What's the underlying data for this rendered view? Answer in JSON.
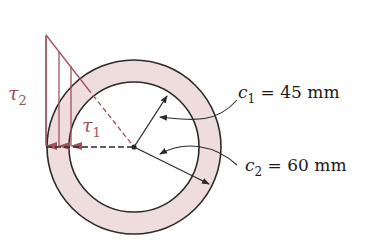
{
  "figure": {
    "type": "hollow-shaft-cross-section",
    "colors": {
      "ring_fill": "#efdcdc",
      "outline": "#2a2a2a",
      "stress": "#a0525a",
      "background": "#ffffff"
    }
  },
  "labels": {
    "tau2": "τ",
    "tau2_sub": "2",
    "tau1": "τ",
    "tau1_sub": "1",
    "c1_sym": "c",
    "c1_sub": "1",
    "c1_rest": " = 45 mm",
    "c2_sym": "c",
    "c2_sub": "2",
    "c2_rest": " = 60 mm"
  },
  "dimensions": {
    "c1": "45 mm",
    "c2": "60 mm"
  }
}
